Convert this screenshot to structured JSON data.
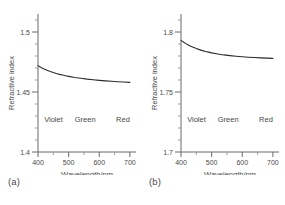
{
  "figure": {
    "background": "#ffffff",
    "curve_color": "#2b2b2b",
    "axis_color": "#6b6b6b",
    "text_color": "#4a4a4a"
  },
  "panels": [
    {
      "caption": "(a)",
      "name": "panel-a"
    },
    {
      "caption": "(b)",
      "name": "panel-b"
    }
  ],
  "chart_data": [
    {
      "type": "line",
      "title": "",
      "subtitle": "",
      "panel_label": "(a)",
      "xlabel": "Wavelength/nm",
      "ylabel": "Refractive index",
      "xlim": [
        400,
        720
      ],
      "ylim": [
        1.4,
        1.515
      ],
      "xticks": [
        400,
        500,
        600,
        700
      ],
      "xtick_labels": [
        "400",
        "500",
        "600",
        "700"
      ],
      "yticks": [
        1.4,
        1.45,
        1.5
      ],
      "ytick_labels": [
        "1.4",
        "1.45",
        "1.5"
      ],
      "y_minor_ticks": [
        1.41,
        1.42,
        1.43,
        1.44,
        1.46,
        1.47,
        1.48,
        1.49,
        1.51
      ],
      "x_minor_ticks": [
        450,
        550,
        650
      ],
      "grid": false,
      "legend": "none",
      "annotations": [
        {
          "text": "Violet",
          "x": 420,
          "y": 1.425
        },
        {
          "text": "Green",
          "x": 520,
          "y": 1.425
        },
        {
          "text": "Red",
          "x": 655,
          "y": 1.425
        }
      ],
      "x": [
        400,
        410,
        420,
        430,
        440,
        450,
        460,
        470,
        480,
        490,
        500,
        520,
        540,
        560,
        580,
        600,
        620,
        640,
        660,
        680,
        700
      ],
      "values": [
        1.472,
        1.4705,
        1.4692,
        1.4681,
        1.4671,
        1.4662,
        1.4654,
        1.4647,
        1.4641,
        1.4635,
        1.463,
        1.4621,
        1.4614,
        1.4607,
        1.4602,
        1.4597,
        1.4593,
        1.4589,
        1.4586,
        1.4583,
        1.458
      ]
    },
    {
      "type": "line",
      "title": "",
      "subtitle": "",
      "panel_label": "(b)",
      "xlabel": "Wavelength/nm",
      "ylabel": "Refractive index",
      "xlim": [
        400,
        720
      ],
      "ylim": [
        1.7,
        1.815
      ],
      "xticks": [
        400,
        500,
        600,
        700
      ],
      "xtick_labels": [
        "400",
        "500",
        "600",
        "700"
      ],
      "yticks": [
        1.7,
        1.75,
        1.8
      ],
      "ytick_labels": [
        "1.7",
        "1.75",
        "1.8"
      ],
      "y_minor_ticks": [
        1.71,
        1.72,
        1.73,
        1.74,
        1.76,
        1.77,
        1.78,
        1.79,
        1.81
      ],
      "x_minor_ticks": [
        450,
        550,
        650
      ],
      "grid": false,
      "legend": "none",
      "annotations": [
        {
          "text": "Violet",
          "x": 420,
          "y": 1.725
        },
        {
          "text": "Green",
          "x": 520,
          "y": 1.725
        },
        {
          "text": "Red",
          "x": 655,
          "y": 1.725
        }
      ],
      "x": [
        400,
        410,
        420,
        430,
        440,
        450,
        460,
        470,
        480,
        490,
        500,
        520,
        540,
        560,
        580,
        600,
        620,
        640,
        660,
        680,
        700
      ],
      "values": [
        1.793,
        1.7912,
        1.7897,
        1.7884,
        1.7872,
        1.7862,
        1.7853,
        1.7845,
        1.7838,
        1.7832,
        1.7826,
        1.7817,
        1.7809,
        1.7803,
        1.7798,
        1.7794,
        1.779,
        1.7787,
        1.7784,
        1.7782,
        1.778
      ]
    }
  ]
}
